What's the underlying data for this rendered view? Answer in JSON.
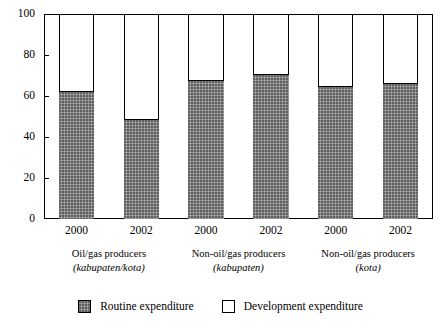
{
  "chart_data": {
    "type": "bar",
    "stacked": true,
    "title": "",
    "subtitle": "",
    "xlabel": "",
    "ylabel": "",
    "ylim": [
      0,
      100
    ],
    "yticks": [
      0,
      20,
      40,
      60,
      80,
      100
    ],
    "ytick_labels": [
      "0",
      "20",
      "40",
      "60",
      "80",
      "100"
    ],
    "grid": false,
    "legend_position": "bottom",
    "categories": [
      "2000",
      "2002",
      "2000",
      "2002",
      "2000",
      "2002"
    ],
    "groups": [
      {
        "line1": "Oil/gas producers",
        "line2": "(kabupaten/kota)",
        "categories": [
          "2000",
          "2002"
        ]
      },
      {
        "line1": "Non-oil/gas producers",
        "line2": "(kabupaten)",
        "categories": [
          "2000",
          "2002"
        ]
      },
      {
        "line1": "Non-oil/gas producers",
        "line2": "(kota)",
        "categories": [
          "2000",
          "2002"
        ]
      }
    ],
    "series": [
      {
        "name": "Routine expenditure",
        "color": "#8e8e8e",
        "values": [
          62.5,
          49.0,
          68.0,
          70.5,
          65.0,
          66.5
        ]
      },
      {
        "name": "Development expenditure",
        "color": "#ffffff",
        "values": [
          37.5,
          51.0,
          32.0,
          29.5,
          35.0,
          33.5
        ]
      }
    ]
  },
  "legend": {
    "items": [
      {
        "label": "Routine expenditure",
        "swatch": "routine"
      },
      {
        "label": "Development expenditure",
        "swatch": "development"
      }
    ]
  },
  "colors": {
    "routine": "#8e8e8e",
    "development": "#ffffff",
    "axis": "#000000",
    "background": "#ffffff"
  }
}
